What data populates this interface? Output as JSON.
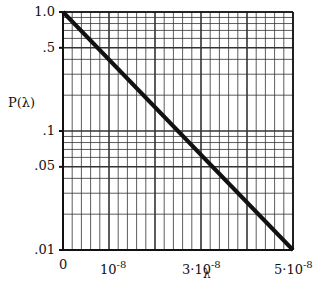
{
  "chart_data": {
    "type": "line",
    "title": "",
    "xlabel": "λ",
    "ylabel": "P(λ)",
    "yscale": "log",
    "xlim": [
      0,
      5e-08
    ],
    "ylim": [
      0.01,
      1.0
    ],
    "grid": true,
    "x_ticks": [
      {
        "value": 0,
        "label": "0"
      },
      {
        "value": 1e-08,
        "label": "10",
        "exp": "-8"
      },
      {
        "value": 3e-08,
        "label": "3·10",
        "exp": "-8"
      },
      {
        "value": 5e-08,
        "label": "5·10",
        "exp": "-8"
      }
    ],
    "y_ticks": [
      {
        "value": 1.0,
        "label": "1.0"
      },
      {
        "value": 0.5,
        "label": ".5"
      },
      {
        "value": 0.1,
        "label": ".1"
      },
      {
        "value": 0.05,
        "label": ".05"
      },
      {
        "value": 0.01,
        "label": ".01"
      }
    ],
    "series": [
      {
        "name": "P(λ)",
        "x": [
          0,
          5e-08
        ],
        "y": [
          1.0,
          0.01
        ]
      }
    ]
  },
  "colors": {
    "line": "#111111",
    "grid": "#333333",
    "background": "#ffffff"
  }
}
